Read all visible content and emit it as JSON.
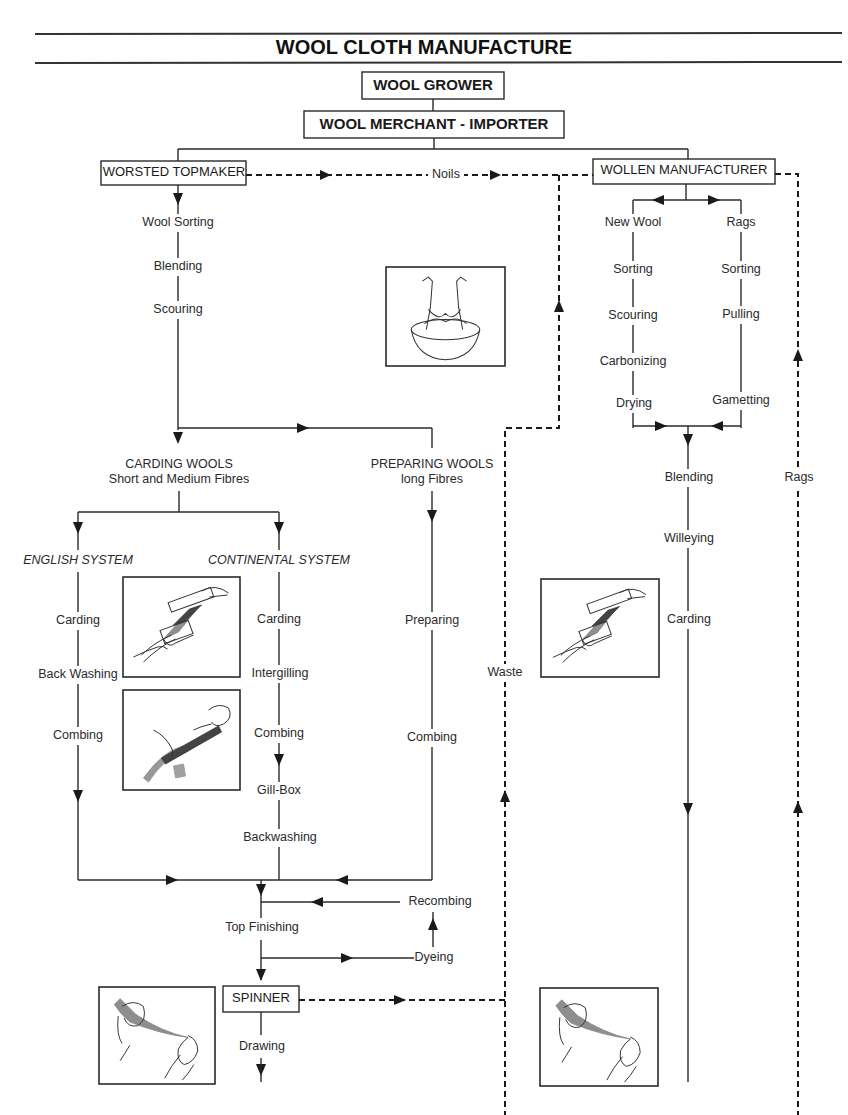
{
  "title": "WOOL CLOTH MANUFACTURE",
  "nodes": {
    "wool_grower": "WOOL GROWER",
    "wool_merchant": "WOOL MERCHANT - IMPORTER",
    "worsted_topmaker": "WORSTED TOPMAKER",
    "wollen_manufacturer": "WOLLEN MANUFACTURER",
    "spinner": "SPINNER"
  },
  "links": {
    "noils": "Noils",
    "waste": "Waste",
    "rags_return": "Rags"
  },
  "worsted": {
    "steps": [
      "Wool Sorting",
      "Blending",
      "Scouring"
    ],
    "carding_wools": {
      "title": "CARDING WOOLS",
      "subtitle": "Short and Medium Fibres"
    },
    "preparing_wools": {
      "title": "PREPARING WOOLS",
      "subtitle": "long Fibres",
      "steps": [
        "Preparing",
        "Combing"
      ]
    },
    "english_system": {
      "title": "ENGLISH SYSTEM",
      "steps": [
        "Carding",
        "Back Washing",
        "Combing"
      ]
    },
    "continental_system": {
      "title": "CONTINENTAL SYSTEM",
      "steps": [
        "Carding",
        "Intergilling",
        "Combing",
        "Gill-Box",
        "Backwashing"
      ]
    },
    "finishing": {
      "top_finishing": "Top Finishing",
      "recombing": "Recombing",
      "dyeing": "Dyeing"
    },
    "spinner_steps": [
      "Drawing"
    ]
  },
  "woollen": {
    "new_wool": {
      "title": "New Wool",
      "steps": [
        "Sorting",
        "Scouring",
        "Carbonizing",
        "Drying"
      ]
    },
    "rags": {
      "title": "Rags",
      "steps": [
        "Sorting",
        "Pulling",
        "Gametting"
      ]
    },
    "steps": [
      "Blending",
      "Willeying",
      "Carding"
    ]
  },
  "illustrations": [
    {
      "id": "scouring-illustration",
      "depicts": "hands washing fleece in bowl"
    },
    {
      "id": "hand-carding-illustration",
      "depicts": "hand cards"
    },
    {
      "id": "hand-combing-illustration",
      "depicts": "wool comb"
    },
    {
      "id": "woollen-carding-illustration",
      "depicts": "hand cards"
    },
    {
      "id": "drawing-illustration-left",
      "depicts": "hands drawing fibres"
    },
    {
      "id": "drawing-illustration-right",
      "depicts": "hands drawing fibres"
    }
  ]
}
